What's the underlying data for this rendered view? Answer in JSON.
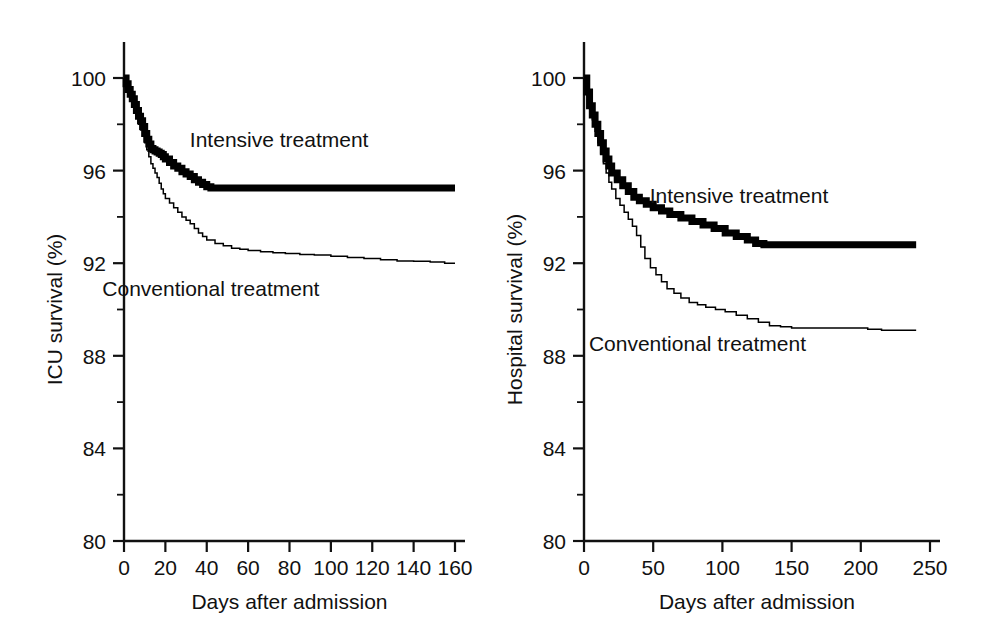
{
  "figure": {
    "background": "#ffffff",
    "ink_color": "#000000"
  },
  "chart_data": [
    {
      "type": "line",
      "panel": "left",
      "title": "",
      "xlabel": "Days after admission",
      "ylabel": "ICU survival (%)",
      "xlim": [
        0,
        160
      ],
      "ylim": [
        80,
        100
      ],
      "xticks": [
        0,
        20,
        40,
        60,
        80,
        100,
        120,
        140,
        160
      ],
      "xticklabels": [
        "0",
        "20",
        "40",
        "60",
        "80",
        "100",
        "120",
        "140",
        "160"
      ],
      "yticks": [
        80,
        84,
        88,
        92,
        96,
        100
      ],
      "yticklabels": [
        "80",
        "84",
        "88",
        "92",
        "96",
        "100"
      ],
      "yminorticks": [
        82,
        86,
        90,
        94,
        98
      ],
      "grid": false,
      "legend_position": "in-plot",
      "annotations": [
        {
          "text": "Intensive treatment",
          "x": 75,
          "y": 97.0
        },
        {
          "text": "Conventional treatment",
          "x": 42,
          "y": 90.6
        }
      ],
      "series": [
        {
          "name": "Intensive treatment",
          "style": "thick",
          "x": [
            0,
            1,
            2,
            3,
            4,
            5,
            6,
            7,
            8,
            9,
            10,
            11,
            12,
            13,
            14,
            15,
            16,
            17,
            18,
            19,
            20,
            22,
            24,
            26,
            28,
            30,
            32,
            34,
            36,
            38,
            40,
            42,
            45,
            50,
            60,
            80,
            100,
            120,
            140,
            160
          ],
          "y": [
            100.0,
            99.75,
            99.5,
            99.3,
            99.1,
            98.85,
            98.6,
            98.35,
            98.15,
            97.9,
            97.6,
            97.35,
            97.15,
            96.95,
            96.9,
            96.85,
            96.8,
            96.75,
            96.7,
            96.6,
            96.5,
            96.35,
            96.2,
            96.1,
            95.95,
            95.85,
            95.75,
            95.6,
            95.5,
            95.4,
            95.3,
            95.25,
            95.25,
            95.25,
            95.25,
            95.25,
            95.25,
            95.25,
            95.25,
            95.25
          ]
        },
        {
          "name": "Conventional treatment",
          "style": "thin",
          "x": [
            0,
            1,
            2,
            3,
            4,
            5,
            6,
            7,
            8,
            9,
            10,
            11,
            12,
            13,
            14,
            15,
            16,
            17,
            18,
            19,
            20,
            22,
            24,
            26,
            28,
            30,
            32,
            34,
            36,
            38,
            40,
            44,
            48,
            52,
            56,
            60,
            66,
            72,
            78,
            85,
            92,
            100,
            108,
            116,
            124,
            132,
            140,
            148,
            155,
            160
          ],
          "y": [
            100.0,
            99.7,
            99.4,
            99.1,
            98.85,
            98.6,
            98.3,
            98.0,
            97.75,
            97.5,
            97.2,
            96.9,
            96.6,
            96.3,
            96.1,
            95.9,
            95.7,
            95.45,
            95.2,
            95.0,
            94.8,
            94.6,
            94.4,
            94.2,
            94.0,
            93.85,
            93.7,
            93.5,
            93.3,
            93.15,
            93.0,
            92.85,
            92.75,
            92.65,
            92.6,
            92.55,
            92.5,
            92.45,
            92.42,
            92.38,
            92.35,
            92.3,
            92.25,
            92.2,
            92.15,
            92.1,
            92.08,
            92.05,
            92.0,
            92.0
          ]
        }
      ]
    },
    {
      "type": "line",
      "panel": "right",
      "title": "",
      "xlabel": "Days after admission",
      "ylabel": "Hospital survival (%)",
      "xlim": [
        0,
        250
      ],
      "ylim": [
        80,
        100
      ],
      "xticks": [
        0,
        50,
        100,
        150,
        200,
        250
      ],
      "xticklabels": [
        "0",
        "50",
        "100",
        "150",
        "200",
        "250"
      ],
      "yticks": [
        80,
        84,
        88,
        92,
        96,
        100
      ],
      "yticklabels": [
        "80",
        "84",
        "88",
        "92",
        "96",
        "100"
      ],
      "yminorticks": [
        82,
        86,
        90,
        94,
        98
      ],
      "grid": false,
      "legend_position": "in-plot",
      "annotations": [
        {
          "text": "Intensive treatment",
          "x": 112,
          "y": 94.6
        },
        {
          "text": "Conventional treatment",
          "x": 82,
          "y": 88.2
        }
      ],
      "series": [
        {
          "name": "Intensive treatment",
          "style": "thick",
          "x": [
            0,
            2,
            4,
            6,
            8,
            10,
            12,
            14,
            16,
            18,
            20,
            24,
            28,
            32,
            36,
            40,
            45,
            50,
            56,
            62,
            70,
            78,
            86,
            94,
            102,
            110,
            118,
            124,
            130,
            140,
            160,
            180,
            200,
            220,
            240
          ],
          "y": [
            100.0,
            99.4,
            98.8,
            98.4,
            98.0,
            97.6,
            97.2,
            96.85,
            96.5,
            96.2,
            95.9,
            95.6,
            95.35,
            95.1,
            94.85,
            94.7,
            94.55,
            94.4,
            94.25,
            94.1,
            93.95,
            93.8,
            93.65,
            93.5,
            93.3,
            93.15,
            93.0,
            92.85,
            92.8,
            92.8,
            92.8,
            92.8,
            92.8,
            92.8,
            92.8
          ]
        },
        {
          "name": "Conventional treatment",
          "style": "thin",
          "x": [
            0,
            2,
            4,
            6,
            8,
            10,
            12,
            14,
            16,
            18,
            20,
            23,
            26,
            29,
            32,
            35,
            38,
            41,
            44,
            48,
            52,
            56,
            60,
            65,
            70,
            76,
            82,
            88,
            95,
            102,
            110,
            118,
            126,
            134,
            142,
            150,
            160,
            175,
            190,
            205,
            215,
            225,
            240
          ],
          "y": [
            100.0,
            99.3,
            98.7,
            98.2,
            97.7,
            97.2,
            96.7,
            96.3,
            95.9,
            95.5,
            95.2,
            94.8,
            94.5,
            94.2,
            93.9,
            93.6,
            93.2,
            92.7,
            92.2,
            91.8,
            91.5,
            91.2,
            90.9,
            90.7,
            90.5,
            90.3,
            90.2,
            90.1,
            90.0,
            89.9,
            89.75,
            89.6,
            89.45,
            89.3,
            89.25,
            89.2,
            89.2,
            89.2,
            89.2,
            89.15,
            89.1,
            89.1,
            89.1
          ]
        }
      ]
    }
  ]
}
